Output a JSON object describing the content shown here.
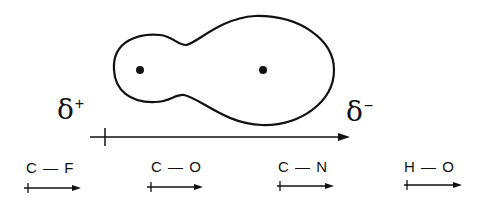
{
  "diagram": {
    "title": "",
    "molecule": {
      "nuclei": [
        {
          "x": 140,
          "y": 70
        },
        {
          "x": 263,
          "y": 70
        }
      ],
      "partial_charges": {
        "positive": {
          "symbol": "δ",
          "sign": "+"
        },
        "negative": {
          "symbol": "δ",
          "sign": "−"
        }
      }
    },
    "bonds": [
      {
        "label": "C — F"
      },
      {
        "label": "C — O"
      },
      {
        "label": "C — N"
      },
      {
        "label": "H — O"
      }
    ],
    "colors": {
      "ink": "#111111",
      "background": "#ffffff"
    }
  }
}
